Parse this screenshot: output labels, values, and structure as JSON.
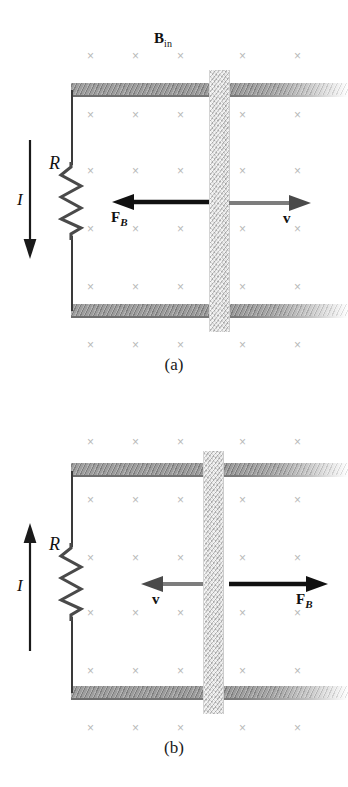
{
  "figure": {
    "background_color": "#ffffff",
    "width": 348,
    "height": 787,
    "field_mark_glyph": "×",
    "field_mark_color": "#b9b9b9",
    "force_arrow_color": "#111111",
    "velocity_arrow_color": "#7d7d7d",
    "rail_color": "#8b8b8b",
    "slider_color": "#d6d6d6",
    "wire_color": "#3a3a3a"
  },
  "panels": [
    {
      "id": "a",
      "caption": "(a)",
      "field_label": "B",
      "field_label_sub": "in",
      "resistor_label": "R",
      "current_label": "I",
      "current_direction": "down",
      "force_label": "F",
      "force_label_sub": "B",
      "force_direction": "left",
      "force_color": "#111111",
      "velocity_label": "v",
      "velocity_direction": "right",
      "velocity_color": "#7d7d7d",
      "field_rows": 5,
      "field_cols": 5
    },
    {
      "id": "b",
      "caption": "(b)",
      "field_label": "",
      "field_label_sub": "",
      "resistor_label": "R",
      "current_label": "I",
      "current_direction": "up",
      "force_label": "F",
      "force_label_sub": "B",
      "force_direction": "right",
      "force_color": "#111111",
      "velocity_label": "v",
      "velocity_direction": "left",
      "velocity_color": "#7d7d7d",
      "field_rows": 5,
      "field_cols": 5
    }
  ]
}
